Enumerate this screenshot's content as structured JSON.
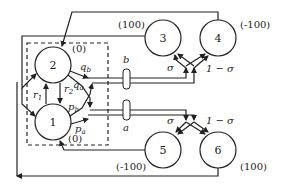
{
  "diagram": {
    "nodes": [
      {
        "id": "1",
        "label": "1"
      },
      {
        "id": "2",
        "label": "2"
      },
      {
        "id": "3",
        "label": "3"
      },
      {
        "id": "4",
        "label": "4"
      },
      {
        "id": "5",
        "label": "5"
      },
      {
        "id": "6",
        "label": "6"
      }
    ],
    "values": {
      "node1": "(0)",
      "node2": "(0)",
      "node3": "(100)",
      "node4": "(-100)",
      "node5": "(-100)",
      "node6": "(100)"
    },
    "edge_labels": {
      "r1": "r",
      "r1_sub": "1",
      "r2": "r",
      "r2_sub": "2",
      "qb": "q",
      "qb_sub": "b",
      "qa": "q",
      "qa_sub": "a",
      "pb": "p",
      "pb_sub": "b",
      "pa": "p",
      "pa_sub": "a",
      "sigma_top": "σ",
      "one_minus_sigma_top": "1 − σ",
      "sigma_bottom": "σ",
      "one_minus_sigma_bottom": "1 − σ"
    },
    "actions": {
      "b": "b",
      "a": "a"
    },
    "colors": {
      "stroke": "#222222",
      "background": "#ffffff"
    }
  }
}
